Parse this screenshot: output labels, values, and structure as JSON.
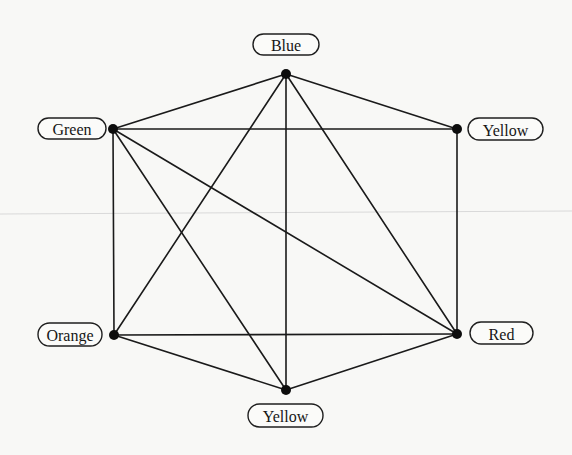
{
  "diagram": {
    "type": "graph",
    "colors": {
      "background": "#f8f8f6",
      "edge": "#1a1a1a",
      "node": "#0d0d0d",
      "label_border": "#1f1f1f",
      "text": "#161616",
      "scan_artifact": "#d9d9d9"
    },
    "nodes": [
      {
        "id": "blue",
        "label": "Blue",
        "x": 286,
        "y": 74,
        "pill": {
          "x": 253,
          "y": 34,
          "w": 66,
          "h": 21
        }
      },
      {
        "id": "green",
        "label": "Green",
        "x": 113,
        "y": 129,
        "pill": {
          "x": 38,
          "y": 118,
          "w": 68,
          "h": 21
        }
      },
      {
        "id": "yellow-top",
        "label": "Yellow",
        "x": 457,
        "y": 129,
        "pill": {
          "x": 468,
          "y": 118,
          "w": 75,
          "h": 22
        }
      },
      {
        "id": "orange",
        "label": "Orange",
        "x": 114,
        "y": 335,
        "pill": {
          "x": 38,
          "y": 323,
          "w": 64,
          "h": 23
        }
      },
      {
        "id": "red",
        "label": "Red",
        "x": 457,
        "y": 334,
        "pill": {
          "x": 470,
          "y": 322,
          "w": 63,
          "h": 22
        }
      },
      {
        "id": "yellow-bottom",
        "label": "Yellow",
        "x": 286,
        "y": 390,
        "pill": {
          "x": 248,
          "y": 404,
          "w": 75,
          "h": 23
        }
      }
    ],
    "edges": [
      [
        "blue",
        "green"
      ],
      [
        "blue",
        "yellow-top"
      ],
      [
        "blue",
        "orange"
      ],
      [
        "blue",
        "yellow-bottom"
      ],
      [
        "blue",
        "red"
      ],
      [
        "green",
        "yellow-top"
      ],
      [
        "green",
        "orange"
      ],
      [
        "green",
        "yellow-bottom"
      ],
      [
        "green",
        "red"
      ],
      [
        "yellow-top",
        "red"
      ],
      [
        "orange",
        "red"
      ],
      [
        "orange",
        "yellow-bottom"
      ],
      [
        "red",
        "yellow-bottom"
      ]
    ],
    "artifacts": {
      "scan_line": {
        "x1": 0,
        "y1": 214,
        "x2": 572,
        "y2": 211
      }
    }
  }
}
